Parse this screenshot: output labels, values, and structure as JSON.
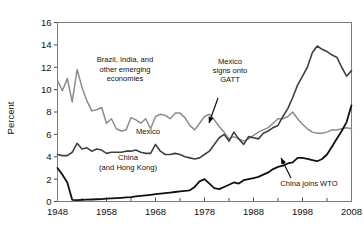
{
  "chart_data": {
    "type": "line",
    "title": "",
    "xlabel": "",
    "ylabel": "Percent",
    "xlim": [
      1948,
      2008
    ],
    "ylim": [
      0,
      16
    ],
    "ytick_step": 2,
    "xtick_major_step": 10,
    "xtick_minor_step": 5,
    "grid": false,
    "legend": "inline-labels",
    "ytick_labels": [
      "0",
      "2",
      "4",
      "6",
      "8",
      "10",
      "12",
      "14",
      "16"
    ],
    "ytick_values": [
      0,
      2,
      4,
      6,
      8,
      10,
      12,
      14,
      16
    ],
    "xtick_labels": [
      "1948",
      "1958",
      "1968",
      "1978",
      "1988",
      "1998",
      "2008"
    ],
    "xtick_values": [
      1948,
      1958,
      1968,
      1978,
      1988,
      1998,
      2008
    ],
    "xtick_minor_values": [
      1953,
      1963,
      1973,
      1983,
      1993,
      2003
    ],
    "series": [
      {
        "name": "Brazil, India, and other emerging economies",
        "color": "#8c8c8c",
        "stroke_width": 1.5,
        "label_text": [
          "Brazil, India, and",
          "other emerging",
          "economies"
        ],
        "x": [
          1948,
          1949,
          1950,
          1951,
          1952,
          1953,
          1954,
          1955,
          1956,
          1957,
          1958,
          1959,
          1960,
          1961,
          1962,
          1963,
          1964,
          1965,
          1966,
          1967,
          1968,
          1969,
          1970,
          1971,
          1972,
          1973,
          1974,
          1975,
          1976,
          1977,
          1978,
          1979,
          1980,
          1981,
          1982,
          1983,
          1984,
          1985,
          1986,
          1987,
          1988,
          1989,
          1990,
          1991,
          1992,
          1993,
          1994,
          1995,
          1996,
          1997,
          1998,
          1999,
          2000,
          2001,
          2002,
          2003,
          2004,
          2005,
          2006,
          2007,
          2008
        ],
        "values": [
          10.8,
          9.9,
          11.0,
          8.9,
          11.8,
          10.2,
          9.0,
          8.1,
          8.2,
          8.4,
          7.0,
          7.4,
          6.5,
          6.3,
          6.4,
          7.5,
          7.3,
          7.0,
          7.4,
          6.5,
          7.6,
          7.8,
          7.7,
          7.4,
          7.9,
          7.9,
          7.5,
          6.8,
          6.4,
          7.0,
          7.6,
          7.8,
          7.3,
          6.7,
          6.2,
          5.6,
          5.8,
          5.6,
          5.4,
          5.6,
          5.9,
          6.2,
          6.4,
          6.6,
          7.0,
          7.4,
          7.4,
          7.6,
          8.0,
          7.4,
          6.9,
          6.5,
          6.2,
          6.1,
          6.1,
          6.2,
          6.4,
          6.4,
          6.5,
          6.6,
          6.5
        ]
      },
      {
        "name": "Mexico",
        "color": "#404040",
        "stroke_width": 1.6,
        "label_text": [
          "Mexico"
        ],
        "x": [
          1948,
          1949,
          1950,
          1951,
          1952,
          1953,
          1954,
          1955,
          1956,
          1957,
          1958,
          1959,
          1960,
          1961,
          1962,
          1963,
          1964,
          1965,
          1966,
          1967,
          1968,
          1969,
          1970,
          1971,
          1972,
          1973,
          1974,
          1975,
          1976,
          1977,
          1978,
          1979,
          1980,
          1981,
          1982,
          1983,
          1984,
          1985,
          1986,
          1987,
          1988,
          1989,
          1990,
          1991,
          1992,
          1993,
          1994,
          1995,
          1996,
          1997,
          1998,
          1999,
          2000,
          2001,
          2002,
          2003,
          2004,
          2005,
          2006,
          2007,
          2008
        ],
        "values": [
          4.2,
          4.1,
          4.1,
          4.4,
          5.2,
          4.7,
          4.8,
          4.5,
          4.7,
          4.6,
          4.3,
          4.4,
          4.4,
          4.4,
          4.5,
          4.5,
          4.6,
          4.4,
          4.3,
          4.3,
          5.1,
          4.5,
          4.2,
          4.2,
          4.3,
          4.2,
          4.0,
          3.9,
          3.8,
          3.9,
          4.2,
          4.5,
          5.1,
          5.7,
          6.0,
          5.4,
          6.2,
          5.6,
          5.1,
          5.8,
          5.7,
          5.6,
          6.1,
          6.3,
          6.6,
          6.8,
          7.6,
          8.3,
          9.3,
          10.4,
          11.2,
          12.0,
          13.3,
          13.9,
          13.6,
          13.4,
          13.1,
          12.9,
          12.0,
          11.2,
          11.7
        ]
      },
      {
        "name": "China (and Hong Kong)",
        "color": "#111111",
        "stroke_width": 1.8,
        "label_text": [
          "China",
          "(and Hong Kong)"
        ],
        "x": [
          1948,
          1949,
          1950,
          1951,
          1952,
          1953,
          1954,
          1955,
          1956,
          1957,
          1958,
          1959,
          1960,
          1961,
          1962,
          1963,
          1964,
          1965,
          1966,
          1967,
          1968,
          1969,
          1970,
          1971,
          1972,
          1973,
          1974,
          1975,
          1976,
          1977,
          1978,
          1979,
          1980,
          1981,
          1982,
          1983,
          1984,
          1985,
          1986,
          1987,
          1988,
          1989,
          1990,
          1991,
          1992,
          1993,
          1994,
          1995,
          1996,
          1997,
          1998,
          1999,
          2000,
          2001,
          2002,
          2003,
          2004,
          2005,
          2006,
          2007,
          2008
        ],
        "values": [
          3.0,
          2.4,
          1.7,
          0.15,
          0.12,
          0.14,
          0.16,
          0.18,
          0.2,
          0.22,
          0.25,
          0.28,
          0.3,
          0.33,
          0.36,
          0.4,
          0.45,
          0.5,
          0.55,
          0.6,
          0.65,
          0.7,
          0.75,
          0.8,
          0.85,
          0.9,
          0.95,
          1.0,
          1.3,
          1.8,
          2.0,
          1.6,
          1.2,
          1.1,
          1.3,
          1.5,
          1.7,
          1.6,
          1.9,
          2.0,
          2.1,
          2.2,
          2.4,
          2.6,
          2.9,
          3.1,
          3.2,
          3.4,
          3.5,
          3.9,
          3.9,
          3.8,
          3.7,
          3.6,
          3.8,
          4.2,
          4.9,
          5.6,
          6.3,
          7.1,
          8.6
        ]
      }
    ],
    "annotations": [
      {
        "name": "mexico-gatt-annotation",
        "text": [
          "Mexico",
          "signs onto",
          "GATT"
        ],
        "points_to_year": 1986
      },
      {
        "name": "china-wto-annotation",
        "text": [
          "China joins WTO"
        ],
        "points_to_year": 2001
      }
    ]
  }
}
